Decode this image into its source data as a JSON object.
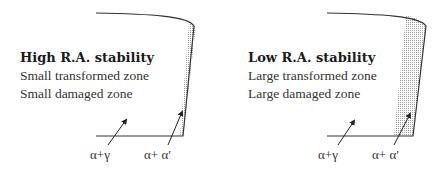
{
  "panels": [
    {
      "title": "High R.A. stability",
      "lines": [
        "Small transformed zone",
        "Small damaged zone"
      ],
      "labels": {
        "left": "α+γ",
        "right": "α+ α′"
      }
    },
    {
      "title": "Low R.A. stability",
      "lines": [
        "Large transformed zone",
        "Large damaged zone"
      ],
      "labels": {
        "left": "α+γ",
        "right": "α+ α′"
      }
    }
  ],
  "colors": {
    "outline": "#333333",
    "stipple": "#bdbdbd",
    "text": "#333333"
  }
}
